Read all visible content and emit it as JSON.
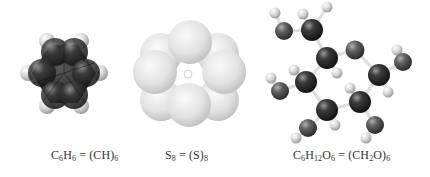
{
  "figure": {
    "panels": [
      {
        "id": "benzene",
        "model": "space-filling",
        "formula": {
          "parts": [
            {
              "t": "C"
            },
            {
              "t": "6",
              "sub": true
            },
            {
              "t": "H"
            },
            {
              "t": "6",
              "sub": true
            },
            {
              "t": " = (CH)"
            },
            {
              "t": "6",
              "sub": true
            }
          ]
        },
        "caption_text": "C6H6 = (CH)6"
      },
      {
        "id": "sulfur",
        "model": "space-filling",
        "formula": {
          "parts": [
            {
              "t": "S"
            },
            {
              "t": "8",
              "sub": true
            },
            {
              "t": " = (S)"
            },
            {
              "t": "8",
              "sub": true
            }
          ]
        },
        "caption_text": "S8 = (S)8"
      },
      {
        "id": "glucose",
        "model": "ball-and-stick",
        "formula": {
          "parts": [
            {
              "t": "C"
            },
            {
              "t": "6",
              "sub": true
            },
            {
              "t": "H"
            },
            {
              "t": "12",
              "sub": true
            },
            {
              "t": "O"
            },
            {
              "t": "6",
              "sub": true
            },
            {
              "t": " = (CH"
            },
            {
              "t": "2",
              "sub": true
            },
            {
              "t": "O)"
            },
            {
              "t": "6",
              "sub": true
            }
          ]
        },
        "caption_text": "C6H12O6 = (CH2O)6"
      }
    ],
    "colors": {
      "carbon": "#2a2a2a",
      "hydrogen": "#d8d8d8",
      "oxygen": "#555555",
      "sulfur": "#e6e6e6",
      "bond": "#e0e0e0",
      "caption": "#333333"
    }
  }
}
